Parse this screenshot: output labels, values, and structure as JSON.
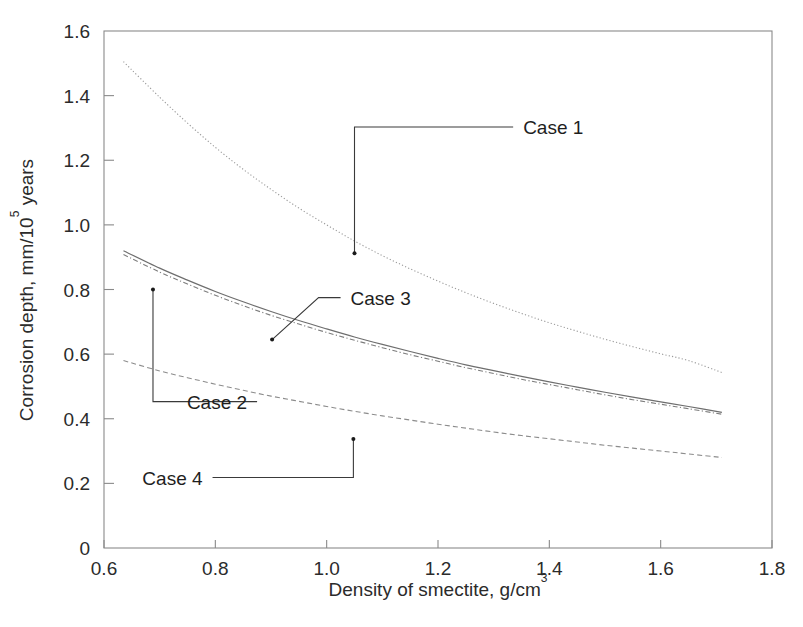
{
  "figure": {
    "background_color": "#ffffff",
    "frame_color": "#8a8a8a",
    "text_color": "#2b2b2b"
  },
  "chart_data": {
    "type": "line",
    "title": "",
    "subtitle": "",
    "xlabel_prefix": "Density of smectite, g/cm",
    "xlabel_sup": "3",
    "xlabel": "Density of smectite, g/cm3",
    "ylabel_prefix": "Corrosion depth,  mm/10",
    "ylabel_sup": "5",
    "ylabel_suffix": " years",
    "ylabel": "Corrosion depth,  mm/10^5 years",
    "xlim": [
      0.6,
      1.8
    ],
    "ylim": [
      0.0,
      1.6
    ],
    "xticks": [
      "0.6",
      "0.8",
      "1.0",
      "1.2",
      "1.4",
      "1.6",
      "1.8"
    ],
    "xtick_values": [
      0.6,
      0.8,
      1.0,
      1.2,
      1.4,
      1.6,
      1.8
    ],
    "yticks": [
      "0",
      "0.2",
      "0.4",
      "0.6",
      "0.8",
      "1.0",
      "1.2",
      "1.4",
      "1.6"
    ],
    "ytick_values": [
      0.0,
      0.2,
      0.4,
      0.6,
      0.8,
      1.0,
      1.2,
      1.4,
      1.6
    ],
    "grid": false,
    "legend_position": "inline-annotations",
    "x": [
      0.635,
      0.7,
      0.75,
      0.8,
      0.85,
      0.9,
      0.95,
      1.0,
      1.05,
      1.1,
      1.15,
      1.2,
      1.25,
      1.3,
      1.35,
      1.4,
      1.45,
      1.5,
      1.55,
      1.6,
      1.65,
      1.71
    ],
    "series": [
      {
        "name": "Case 1",
        "style": "dotted",
        "color": "#9a9a9a",
        "values": [
          1.505,
          1.395,
          1.315,
          1.24,
          1.172,
          1.11,
          1.052,
          1.0,
          0.95,
          0.905,
          0.864,
          0.826,
          0.79,
          0.757,
          0.726,
          0.697,
          0.671,
          0.646,
          0.623,
          0.601,
          0.58,
          0.543
        ]
      },
      {
        "name": "Case 2",
        "style": "solid",
        "color": "#6e6e6e",
        "values": [
          0.92,
          0.866,
          0.829,
          0.794,
          0.762,
          0.732,
          0.704,
          0.678,
          0.653,
          0.63,
          0.608,
          0.587,
          0.567,
          0.549,
          0.531,
          0.514,
          0.498,
          0.482,
          0.467,
          0.452,
          0.438,
          0.42
        ]
      },
      {
        "name": "Case 3",
        "style": "dash-dot",
        "color": "#7d7d7d",
        "values": [
          0.908,
          0.854,
          0.817,
          0.782,
          0.75,
          0.72,
          0.693,
          0.667,
          0.643,
          0.62,
          0.598,
          0.578,
          0.558,
          0.54,
          0.522,
          0.506,
          0.49,
          0.474,
          0.459,
          0.445,
          0.431,
          0.414
        ]
      },
      {
        "name": "Case 4",
        "style": "dashed",
        "color": "#8c8c8c",
        "values": [
          0.58,
          0.548,
          0.527,
          0.507,
          0.488,
          0.47,
          0.454,
          0.438,
          0.423,
          0.409,
          0.396,
          0.383,
          0.371,
          0.359,
          0.348,
          0.338,
          0.328,
          0.318,
          0.309,
          0.3,
          0.291,
          0.28
        ]
      }
    ],
    "annotations": [
      {
        "label": "Case 1",
        "point": {
          "x": 1.05,
          "y": 0.912
        },
        "label_pos": {
          "x": 1.335,
          "y": 1.303
        }
      },
      {
        "label": "Case 2",
        "point": {
          "x": 0.688,
          "y": 0.8
        },
        "label_pos": {
          "x": 0.875,
          "y": 0.453
        }
      },
      {
        "label": "Case 3",
        "point": {
          "x": 0.902,
          "y": 0.645
        },
        "label_pos": {
          "x": 1.025,
          "y": 0.775
        }
      },
      {
        "label": "Case 4",
        "point": {
          "x": 1.048,
          "y": 0.337
        },
        "label_pos": {
          "x": 0.795,
          "y": 0.218
        }
      }
    ]
  }
}
